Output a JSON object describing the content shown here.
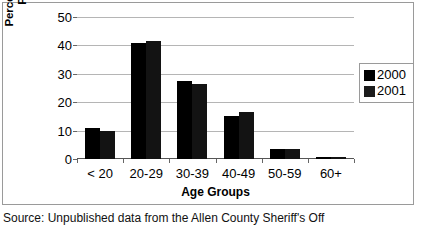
{
  "chart_data": {
    "type": "bar",
    "title": "",
    "categories": [
      "< 20",
      "20-29",
      "30-39",
      "40-49",
      "50-59",
      "60+"
    ],
    "series": [
      {
        "name": "2000",
        "values": [
          11,
          40.7,
          27.5,
          15,
          3.5,
          0.7
        ],
        "color": "#000000"
      },
      {
        "name": "2001",
        "values": [
          10,
          41.4,
          26.5,
          16.5,
          3.5,
          0.7
        ],
        "color": "#131313"
      }
    ],
    "xlabel": "Age Groups",
    "ylabel": "Percent of Inmates\nProcessed",
    "ylim": [
      0,
      50
    ],
    "yticks": [
      0,
      10,
      20,
      30,
      40,
      50
    ],
    "ytick_labels": [
      "0",
      "10",
      "20",
      "30",
      "40",
      "50"
    ],
    "grid": true,
    "legend_position": "right"
  },
  "legend": {
    "entries": [
      {
        "label": "2000",
        "swatch": "legend-swatch-2000"
      },
      {
        "label": "2001",
        "swatch": "legend-swatch-2001"
      }
    ]
  },
  "caption": {
    "text": "Source: Unpublished data from the Allen County Sheriff's Off"
  }
}
